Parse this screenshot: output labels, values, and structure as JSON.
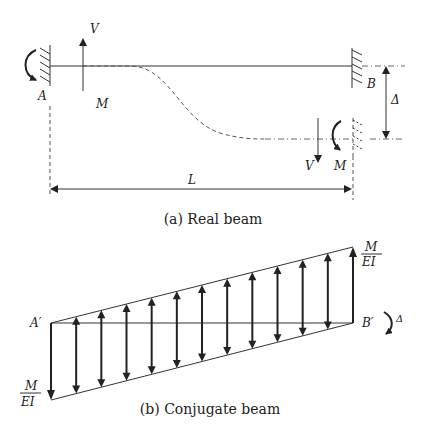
{
  "real_beam": {
    "caption": "(a) Real beam",
    "labels": {
      "support_left": "A",
      "support_right": "B",
      "shear_left": "V",
      "moment_left": "M",
      "shear_right": "V",
      "moment_right": "M",
      "deflection": "Δ",
      "length": "L"
    }
  },
  "conjugate_beam": {
    "caption": "(b) Conjugate beam",
    "labels": {
      "end_left": "A′",
      "end_right": "B′",
      "load_top_num": "M",
      "load_top_den": "EI",
      "load_bottom_num": "M",
      "load_bottom_den": "EI",
      "moment_right": "Δ"
    },
    "arrow_count": 12
  },
  "colors": {
    "stroke": "#333333",
    "text": "#222222",
    "background": "#ffffff"
  }
}
